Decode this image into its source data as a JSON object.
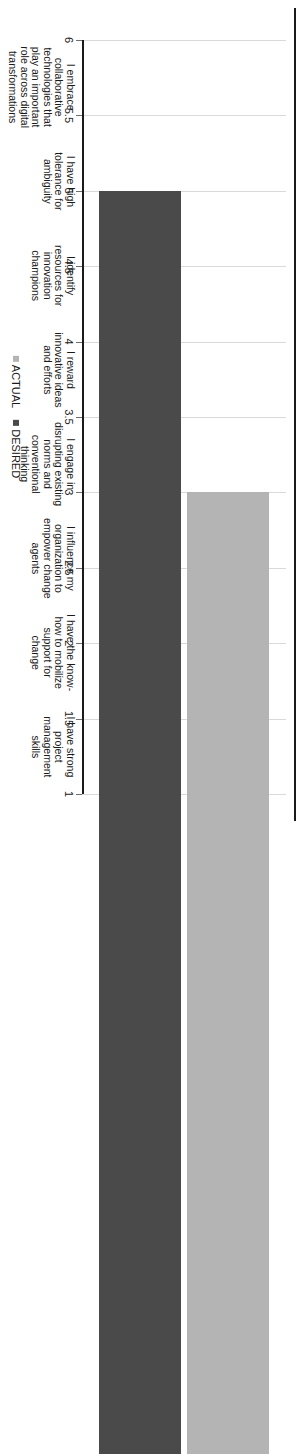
{
  "chart_data": {
    "type": "bar",
    "orientation": "horizontal",
    "title": "",
    "xlabel": "",
    "ylabel": "",
    "xlim": [
      1,
      6
    ],
    "x_reversed": true,
    "grid": true,
    "legend_position": "bottom-center",
    "tick_labels": [
      "6",
      "5.5",
      "5",
      "4.5",
      "4",
      "3.5",
      "3",
      "2.5",
      "2",
      "1.5",
      "1"
    ],
    "tick_values": [
      6,
      5.5,
      5,
      4.5,
      4,
      3.5,
      3,
      2.5,
      2,
      1.5,
      1
    ],
    "categories": [
      "I embrace\ncollaborative\ntechnologies that\nplay an important\nrole across digital\ntransformations",
      "I have high\ntolerance for\nambiguity",
      "I identify\nresources for\ninnovation\nchampions",
      "I reward\ninnovative ideas\nand efforts",
      "I engage in\ndisrupting existing\nnorms and\nconventional\nthinking",
      "I influence my\norganization to\nempower change\nagents",
      "I have the know-\nhow to mobilize\nsupport for\nchange",
      "I have strong\nproject\nmanagement\nskills"
    ],
    "series": [
      {
        "name": "ACTUAL",
        "color": "#b4b4b4",
        "values": [
          3.0,
          3.1,
          2.0,
          2.8,
          2.0,
          3.0,
          3.7,
          4.0
        ]
      },
      {
        "name": "DESIRED",
        "color": "#4a4a4a",
        "values": [
          5.0,
          5.0,
          4.0,
          4.0,
          4.5,
          4.8,
          5.0,
          5.0
        ]
      }
    ]
  },
  "legend": {
    "actual_label": "ACTUAL",
    "desired_label": "DESIRED"
  },
  "colors": {
    "actual": "#b4b4b4",
    "desired": "#4a4a4a",
    "gridline": "#d9d9d9",
    "axis": "#1a1a1a"
  }
}
